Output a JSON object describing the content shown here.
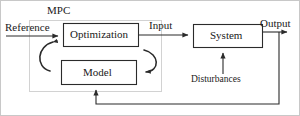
{
  "diagram": {
    "group_label": "MPC",
    "blocks": [
      {
        "id": "optimization",
        "label": "Optimization",
        "x": 62,
        "y": 22,
        "w": 76,
        "h": 24
      },
      {
        "id": "model",
        "label": "Model",
        "x": 60,
        "y": 59,
        "w": 76,
        "h": 25
      },
      {
        "id": "system",
        "label": "System",
        "x": 192,
        "y": 23,
        "w": 70,
        "h": 24
      }
    ],
    "signals": [
      {
        "id": "reference",
        "label": "Reference"
      },
      {
        "id": "input",
        "label": "Input"
      },
      {
        "id": "output",
        "label": "Output"
      },
      {
        "id": "disturbances",
        "label": "Disturbances"
      }
    ],
    "colors": {
      "line": "#2b2b2b",
      "group_border": "#d2d2d2",
      "text": "#1a1a1a",
      "background": "#ffffff"
    }
  }
}
